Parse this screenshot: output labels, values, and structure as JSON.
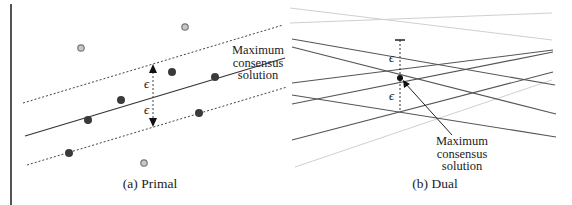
{
  "figure": {
    "panels": [
      {
        "id": "primal",
        "caption": "(a) Primal",
        "annotation": [
          "Maximum",
          "consensus",
          "solution"
        ],
        "epsilon_symbol": "ϵ",
        "inlier_points": [
          [
            172,
            72
          ],
          [
            215,
            77
          ],
          [
            121,
            100
          ],
          [
            88,
            120
          ],
          [
            199,
            113
          ],
          [
            69,
            153
          ]
        ],
        "outlier_points": [
          [
            81,
            48
          ],
          [
            185,
            27
          ],
          [
            144,
            163
          ]
        ],
        "fit_line": [
          [
            25,
            136
          ],
          [
            285,
            58
          ]
        ],
        "upper_band": [
          [
            23,
            103
          ],
          [
            283,
            25
          ]
        ],
        "lower_band": [
          [
            27,
            165
          ],
          [
            287,
            87
          ]
        ]
      },
      {
        "id": "dual",
        "caption": "(b) Dual",
        "annotation": [
          "Maximum",
          "consensus",
          "solution"
        ],
        "epsilon_symbol": "ϵ",
        "solution_point": [
          115,
          78
        ]
      }
    ],
    "colors": {
      "inlier": "#3a3a3a",
      "outlier_fill": "#c8c8c8",
      "outlier_stroke": "#777777",
      "line_dark": "#555555",
      "line_light": "#cfcfcf",
      "text": "#222222"
    }
  }
}
